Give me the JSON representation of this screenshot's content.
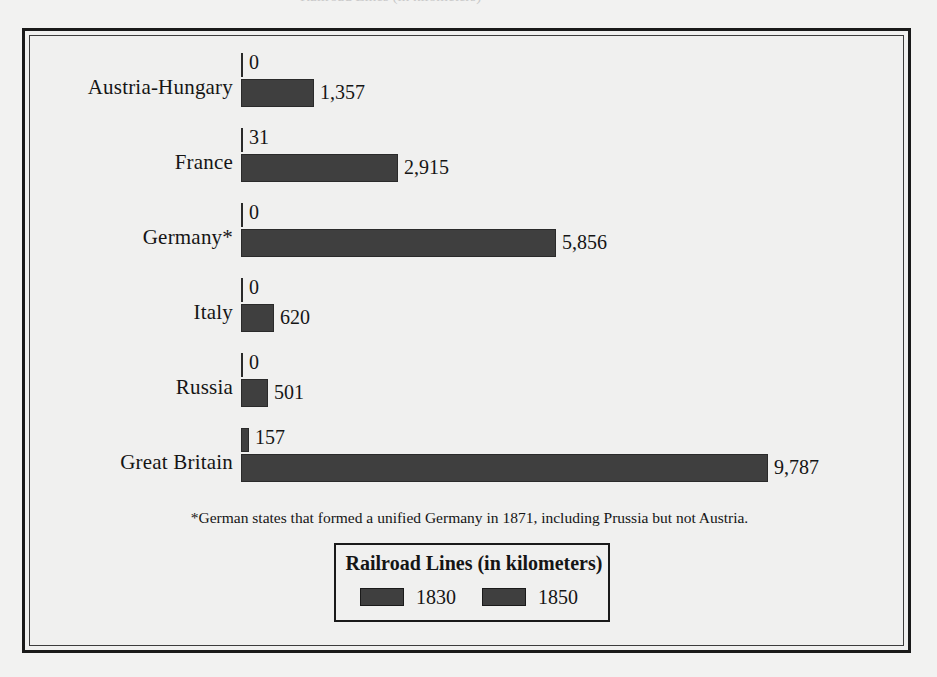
{
  "scan": {
    "top_sliver_ghost": "Railroad Lines (in kilometers)"
  },
  "footnote": "*German states that formed a unified Germany in 1871, including Prussia but not Austria.",
  "legend": {
    "title": "Railroad Lines (in kilometers)",
    "entries": [
      {
        "label": "1830",
        "color": "#3f3f3f",
        "swatch_icon": "legend-swatch-1830"
      },
      {
        "label": "1850",
        "color": "#3f3f3f",
        "swatch_icon": "legend-swatch-1850"
      }
    ]
  },
  "colors": {
    "bar": "#3f3f3f",
    "bar_outline": "#2a2a2a",
    "frame": "#1a1a1a",
    "page": "#f0f0ef",
    "text": "#151515"
  },
  "chart_data": {
    "type": "bar",
    "orientation": "horizontal",
    "title": "Railroad Lines (in kilometers)",
    "xlabel": "",
    "ylabel": "",
    "grid": false,
    "legend_position": "bottom-center",
    "xlim": [
      0,
      9787
    ],
    "categories": [
      "Austria-Hungary",
      "France",
      "Germany*",
      "Italy",
      "Russia",
      "Great Britain"
    ],
    "series": [
      {
        "name": "1830",
        "values": [
          0,
          31,
          0,
          0,
          0,
          157
        ],
        "labels": [
          "0",
          "31",
          "0",
          "0",
          "0",
          "157"
        ]
      },
      {
        "name": "1850",
        "values": [
          1357,
          2915,
          5856,
          620,
          501,
          9787
        ],
        "labels": [
          "1,357",
          "2,915",
          "5,856",
          "620",
          "501",
          "9,787"
        ]
      }
    ],
    "notes": "*German states that formed a unified Germany in 1871, including Prussia but not Austria."
  }
}
